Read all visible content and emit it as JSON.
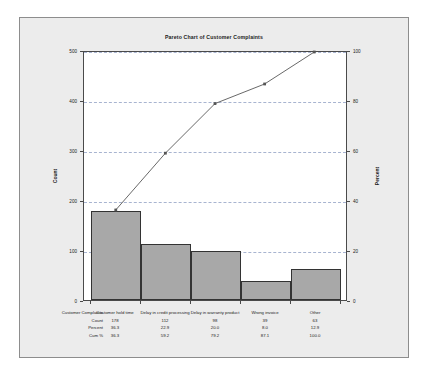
{
  "chart_data": {
    "type": "bar",
    "title": "Pareto Chart of Customer Complaints",
    "categories": [
      "Customer hold time",
      "Delay in credit processing",
      "Delay in warranty product",
      "Wrong invoice",
      "Other"
    ],
    "values": [
      178,
      112,
      98,
      39,
      63
    ],
    "series": [
      {
        "name": "Count",
        "values": [
          178,
          112,
          98,
          39,
          63
        ]
      },
      {
        "name": "Percent",
        "values": [
          36.3,
          22.9,
          20.0,
          8.0,
          12.9
        ]
      },
      {
        "name": "Cum %",
        "values": [
          36.3,
          59.2,
          79.2,
          87.1,
          100.0
        ]
      }
    ],
    "xlabel": "Customer Complaints",
    "ylabel": "Count",
    "y2label": "Percent",
    "ylim": [
      0,
      500
    ],
    "y2lim": [
      0,
      100
    ],
    "yticks": [
      "0",
      "100",
      "200",
      "300",
      "400",
      "500"
    ],
    "ytick_values": [
      0,
      100,
      200,
      300,
      400,
      500
    ],
    "y2ticks": [
      "0",
      "20",
      "40",
      "60",
      "80",
      "100"
    ],
    "y2tick_values": [
      0,
      20,
      40,
      60,
      80,
      100
    ],
    "grid": true,
    "legend": "none",
    "bar_color": "#a8a8a8",
    "bar_edge_color": "#333333",
    "line_color": "#555555",
    "grid_color": "#9aa8c8",
    "panel_color": "#ececec"
  },
  "table": {
    "row_labels": [
      "Customer Complaints",
      "Count",
      "Percent",
      "Cum %"
    ],
    "rows": [
      {
        "label": "Customer Complaints",
        "cells": [
          "Customer hold time",
          "Delay in credit processing",
          "Delay in warranty product",
          "Wrong invoice",
          "Other"
        ]
      },
      {
        "label": "Count",
        "cells": [
          "178",
          "112",
          "98",
          "39",
          "63"
        ]
      },
      {
        "label": "Percent",
        "cells": [
          "36.3",
          "22.9",
          "20.0",
          "8.0",
          "12.9"
        ]
      },
      {
        "label": "Cum %",
        "cells": [
          "36.3",
          "59.2",
          "79.2",
          "87.1",
          "100.0"
        ]
      }
    ]
  }
}
